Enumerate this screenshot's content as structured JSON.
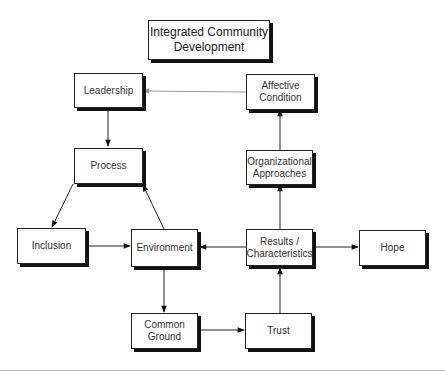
{
  "title": "Integrated Community Development",
  "nodes": {
    "title": "Integrated Community\nDevelopment",
    "leadership": "Leadership",
    "affective": "Affective\nCondition",
    "process": "Process",
    "organizational": "Organizational\nApproaches",
    "inclusion": "Inclusion",
    "environment": "Environment",
    "results": "Results /\nCharacteristics",
    "hope": "Hope",
    "common_ground": "Common\nGround",
    "trust": "Trust"
  },
  "edges": [
    {
      "from": "affective",
      "to": "leadership",
      "color": "#999999"
    },
    {
      "from": "leadership",
      "to": "process",
      "color": "#222222"
    },
    {
      "from": "process",
      "to": "inclusion",
      "color": "#222222"
    },
    {
      "from": "environment",
      "to": "process",
      "color": "#222222"
    },
    {
      "from": "inclusion",
      "to": "environment",
      "color": "#222222"
    },
    {
      "from": "results",
      "to": "environment",
      "color": "#222222"
    },
    {
      "from": "results",
      "to": "hope",
      "color": "#222222"
    },
    {
      "from": "results",
      "to": "organizational",
      "color": "#222222"
    },
    {
      "from": "organizational",
      "to": "affective",
      "color": "#222222"
    },
    {
      "from": "environment",
      "to": "common_ground",
      "color": "#222222"
    },
    {
      "from": "common_ground",
      "to": "trust",
      "color": "#222222"
    },
    {
      "from": "trust",
      "to": "results",
      "color": "#222222"
    }
  ]
}
